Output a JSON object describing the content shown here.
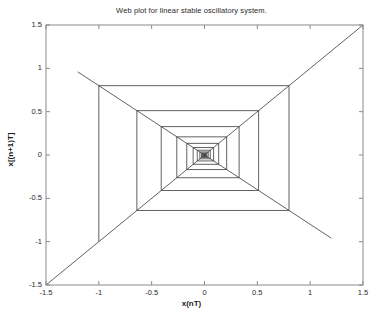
{
  "chart_data": {
    "type": "line",
    "title": "Web plot for linear stable oscillatory system.",
    "xlabel": "x(nT)",
    "ylabel": "x[(n+1)T]",
    "xlim": [
      -1.5,
      1.5
    ],
    "ylim": [
      -1.5,
      1.5
    ],
    "grid": false,
    "legend": null,
    "annotations": [
      {
        "text": "a=-0.8",
        "x": -0.45,
        "y": 1.19
      }
    ],
    "xticks": [
      -1.5,
      -1,
      -0.5,
      0,
      0.5,
      1,
      1.5
    ],
    "xticklabels": [
      "-1.5",
      "-1",
      "-0.5",
      "0",
      "0.5",
      "1",
      "1.5"
    ],
    "yticks": [
      -1.5,
      -1,
      -0.5,
      0,
      0.5,
      1,
      1.5
    ],
    "yticklabels": [
      "-1.5",
      "-1",
      "-0.5",
      "0",
      "0.5",
      "1",
      "1.5"
    ],
    "parameter_a": -0.8,
    "line_color": "#3a3a3a",
    "axis_color": "#8a8a8a",
    "background_color": "#ffffff",
    "series": [
      {
        "name": "identity line y=x",
        "type": "line",
        "x": [
          -1.5,
          1.5
        ],
        "values": [
          -1.5,
          1.5
        ]
      },
      {
        "name": "map line y=-0.8x",
        "type": "line",
        "x": [
          -1.2,
          1.2
        ],
        "values": [
          0.96,
          -0.96
        ]
      },
      {
        "name": "cobweb staircase",
        "type": "line",
        "x": [
          -1.0,
          -1.0,
          0.8,
          0.8,
          -0.64,
          -0.64,
          0.512,
          0.512,
          -0.4096,
          -0.4096,
          0.3277,
          0.3277,
          -0.2621,
          -0.2621,
          0.2097,
          0.2097,
          -0.1678,
          -0.1678,
          0.1342,
          0.1342,
          -0.1074,
          -0.1074,
          0.0859,
          0.0859,
          -0.0687,
          -0.0687,
          0.055,
          0.055,
          -0.044,
          -0.044,
          0.0352,
          0.0352,
          -0.0281,
          -0.0281,
          0.0225,
          0.0225,
          -0.018,
          -0.018,
          0.0144,
          0.0144,
          -0.0115,
          -0.0115,
          0.0092,
          0.0092,
          0.0,
          0.0
        ],
        "values": [
          -1.0,
          0.8,
          0.8,
          -0.64,
          -0.64,
          0.512,
          0.512,
          -0.4096,
          -0.4096,
          0.3277,
          0.3277,
          -0.2621,
          -0.2621,
          0.2097,
          0.2097,
          -0.1678,
          -0.1678,
          0.1342,
          0.1342,
          -0.1074,
          -0.1074,
          0.0859,
          0.0859,
          -0.0687,
          -0.0687,
          0.055,
          0.055,
          -0.044,
          -0.044,
          0.0352,
          0.0352,
          -0.0281,
          -0.0281,
          0.0225,
          0.0225,
          -0.018,
          -0.018,
          0.0144,
          0.0144,
          -0.0115,
          -0.0115,
          0.0092,
          0.0092,
          -0.0074,
          -0.0074,
          0.0
        ]
      }
    ]
  }
}
